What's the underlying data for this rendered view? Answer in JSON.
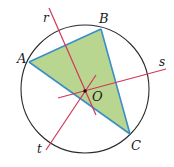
{
  "diagram": {
    "type": "geometry",
    "colors": {
      "circle": "#2b2b2b",
      "triangle_fill": "#b9d690",
      "triangle_stroke": "#3a8fc7",
      "bisector": "#d2365a",
      "center_dot": "#111111",
      "label": "#1a1a1a"
    },
    "circle": {
      "center_label": "O",
      "cx": 85,
      "cy": 89,
      "r": 64
    },
    "points": {
      "A": {
        "label": "A",
        "x": 29,
        "y": 62
      },
      "B": {
        "label": "B",
        "x": 101,
        "y": 29
      },
      "C": {
        "label": "C",
        "x": 130,
        "y": 134
      },
      "O": {
        "label": "O",
        "x": 85,
        "y": 91
      }
    },
    "lines": {
      "r": {
        "label": "r",
        "x1": 49,
        "y1": 8,
        "x2": 96,
        "y2": 115
      },
      "s": {
        "label": "s",
        "x1": 58,
        "y1": 98,
        "x2": 166,
        "y2": 69
      },
      "t": {
        "label": "t",
        "x1": 46,
        "y1": 150,
        "x2": 96,
        "y2": 75
      }
    },
    "labels": {
      "A": "A",
      "B": "B",
      "C": "C",
      "O": "O",
      "r": "r",
      "s": "s",
      "t": "t"
    }
  }
}
